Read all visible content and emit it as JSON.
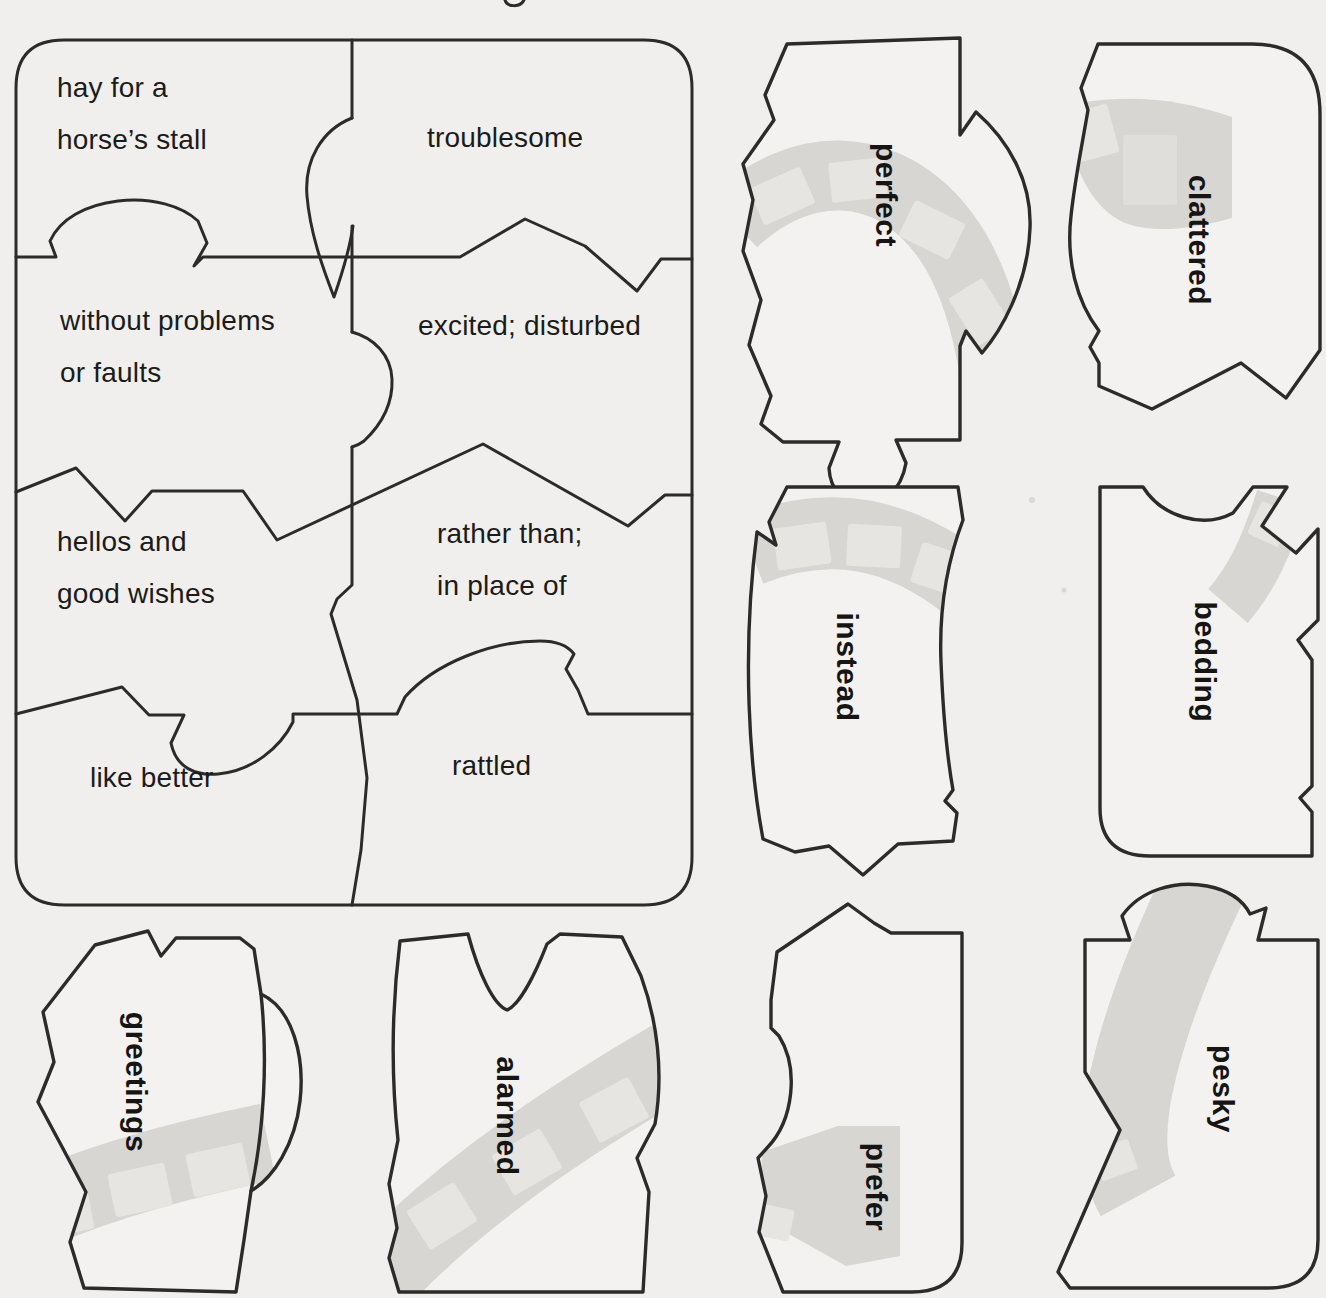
{
  "page": {
    "kind": "vocabulary puzzle worksheet (scanned page)",
    "colors": {
      "background": "#f0efed",
      "outline": "#2c2b29",
      "ribbon": "#d7d6d3",
      "ribbon_patch": "#e6e5e2",
      "text": "#1c1b19"
    }
  },
  "board": {
    "cells": [
      {
        "id": "def-bedding",
        "lines": [
          "hay for a",
          "horse’s stall"
        ]
      },
      {
        "id": "def-pesky",
        "lines": [
          "troublesome"
        ]
      },
      {
        "id": "def-perfect",
        "lines": [
          "without problems",
          "or faults"
        ]
      },
      {
        "id": "def-alarmed",
        "lines": [
          "excited; disturbed"
        ]
      },
      {
        "id": "def-greetings",
        "lines": [
          "hellos and",
          "good wishes"
        ]
      },
      {
        "id": "def-instead",
        "lines": [
          "rather than;",
          "in place of"
        ]
      },
      {
        "id": "def-prefer",
        "lines": [
          "like better"
        ]
      },
      {
        "id": "def-clattered",
        "lines": [
          "rattled"
        ]
      }
    ]
  },
  "pieces": [
    {
      "word": "perfect"
    },
    {
      "word": "clattered"
    },
    {
      "word": "instead"
    },
    {
      "word": "bedding"
    },
    {
      "word": "greetings"
    },
    {
      "word": "alarmed"
    },
    {
      "word": "prefer"
    },
    {
      "word": "pesky"
    }
  ]
}
